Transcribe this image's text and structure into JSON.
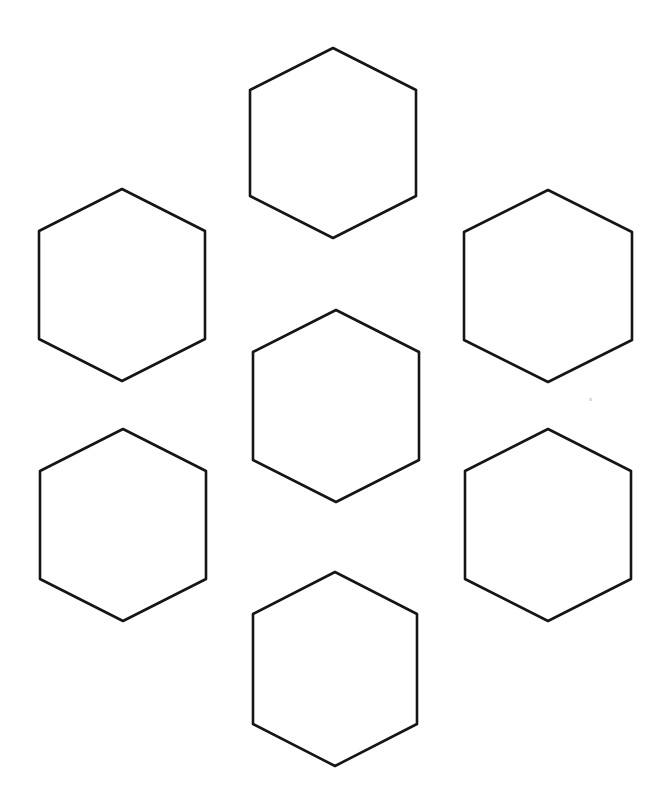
{
  "page": {
    "background_color": "#ffffff",
    "width": 664,
    "height": 807,
    "stroke_color": "#151515",
    "stroke_width": 2.6,
    "fill_color": "#ffffff"
  },
  "shapes": {
    "kind": "hexagon",
    "orientation": "pointy-top",
    "count": 7,
    "items": [
      {
        "id": "hex-top",
        "label": "Top hexagon",
        "center_x": 333,
        "center_y": 143,
        "half_width": 83,
        "half_height": 95,
        "side_run": 42
      },
      {
        "id": "hex-upper-left",
        "label": "Upper left hexagon",
        "center_x": 122,
        "center_y": 285,
        "half_width": 83,
        "half_height": 96,
        "side_run": 42
      },
      {
        "id": "hex-upper-right",
        "label": "Upper right hexagon",
        "center_x": 548,
        "center_y": 286,
        "half_width": 84,
        "half_height": 96,
        "side_run": 42
      },
      {
        "id": "hex-center",
        "label": "Center hexagon",
        "center_x": 336,
        "center_y": 406,
        "half_width": 83,
        "half_height": 96,
        "side_run": 42
      },
      {
        "id": "hex-lower-left",
        "label": "Lower left hexagon",
        "center_x": 123,
        "center_y": 525,
        "half_width": 83,
        "half_height": 96,
        "side_run": 42
      },
      {
        "id": "hex-lower-right",
        "label": "Lower right hexagon",
        "center_x": 548,
        "center_y": 525,
        "half_width": 83,
        "half_height": 96,
        "side_run": 42
      },
      {
        "id": "hex-bottom",
        "label": "Bottom hexagon",
        "center_x": 335,
        "center_y": 669,
        "half_width": 82,
        "half_height": 97,
        "side_run": 42
      }
    ]
  },
  "artifacts": [
    {
      "id": "scan-speck",
      "label": "Faint scan speck",
      "x": 589,
      "y": 398,
      "size": 3,
      "color": "#dcdcdc"
    }
  ]
}
